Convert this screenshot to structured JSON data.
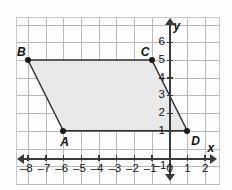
{
  "figure": {
    "kind": "coordinate-plane-parallelogram",
    "top_sliver_text": "",
    "fill_color": "#e9e9e9",
    "grid_color": "#b9b9b9",
    "axis_color": "#3a3a3a",
    "outline_color": "#2b2b2b"
  },
  "axes": {
    "x_name": "x",
    "y_name": "y",
    "x_range": [
      -9,
      3
    ],
    "y_range": [
      -2,
      7
    ],
    "x_ticks": [
      {
        "value": -8,
        "label": "–8"
      },
      {
        "value": -7,
        "label": "–7"
      },
      {
        "value": -6,
        "label": "–6"
      },
      {
        "value": -5,
        "label": "–5"
      },
      {
        "value": -4,
        "label": "–4"
      },
      {
        "value": -3,
        "label": "–3"
      },
      {
        "value": -2,
        "label": "–2"
      },
      {
        "value": -1,
        "label": "–1"
      },
      {
        "value": 0,
        "label": "0"
      },
      {
        "value": 1,
        "label": "1"
      },
      {
        "value": 2,
        "label": "2"
      }
    ],
    "y_ticks": [
      {
        "value": 6,
        "label": "6"
      },
      {
        "value": 5,
        "label": "5"
      },
      {
        "value": 4,
        "label": "4"
      },
      {
        "value": 3,
        "label": "3"
      },
      {
        "value": 2,
        "label": "2"
      },
      {
        "value": 1,
        "label": "1"
      },
      {
        "value": -1,
        "label": "–1"
      }
    ]
  },
  "points": [
    {
      "name": "A",
      "label": "A",
      "x": -6,
      "y": 1,
      "label_pos": "below"
    },
    {
      "name": "B",
      "label": "B",
      "x": -8,
      "y": 5,
      "label_pos": "above-left"
    },
    {
      "name": "C",
      "label": "C",
      "x": -1,
      "y": 5,
      "label_pos": "above-left"
    },
    {
      "name": "D",
      "label": "D",
      "x": 1,
      "y": 1,
      "label_pos": "below-right"
    }
  ],
  "polygon": {
    "vertices": [
      "A",
      "B",
      "C",
      "D"
    ],
    "closed": true
  }
}
